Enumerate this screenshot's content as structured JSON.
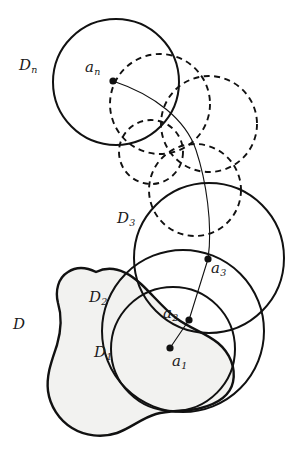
{
  "figure": {
    "kind": "mathematical-diagram",
    "background_color": "#ffffff",
    "stroke_color": "#111111",
    "region_fill": "#f2f2f0",
    "labels": {
      "region": "D",
      "disk1": "D",
      "disk1_sub": "1",
      "disk2": "D",
      "disk2_sub": "2",
      "disk3": "D",
      "disk3_sub": "3",
      "diskn": "D",
      "diskn_sub": "n",
      "point1": "a",
      "point1_sub": "1",
      "point2": "a",
      "point2_sub": "2",
      "point3": "a",
      "point3_sub": "3",
      "pointn": "a",
      "pointn_sub": "n"
    },
    "label_positions": {
      "region": {
        "x": 13,
        "y": 317
      },
      "disk1": {
        "x": 94,
        "y": 345
      },
      "disk2": {
        "x": 89,
        "y": 290
      },
      "disk3": {
        "x": 117,
        "y": 211
      },
      "diskn": {
        "x": 19,
        "y": 58
      },
      "point1": {
        "x": 172,
        "y": 354
      },
      "point2": {
        "x": 163,
        "y": 306
      },
      "point3": {
        "x": 211,
        "y": 261
      },
      "pointn": {
        "x": 85,
        "y": 60
      }
    },
    "solid_disks": [
      {
        "name": "D1",
        "cx": 173,
        "cy": 349,
        "r": 62
      },
      {
        "name": "D2",
        "cx": 183,
        "cy": 331,
        "r": 81
      },
      {
        "name": "D3",
        "cx": 209,
        "cy": 258,
        "r": 75
      },
      {
        "name": "Dn",
        "cx": 116,
        "cy": 82,
        "r": 63
      }
    ],
    "dashed_disks": [
      {
        "cx": 160,
        "cy": 104,
        "r": 50
      },
      {
        "cx": 209,
        "cy": 124,
        "r": 48
      },
      {
        "cx": 151,
        "cy": 152,
        "r": 32
      },
      {
        "cx": 195,
        "cy": 190,
        "r": 46
      }
    ],
    "points": [
      {
        "name": "a1",
        "x": 170,
        "y": 348
      },
      {
        "name": "a2",
        "x": 189,
        "y": 320
      },
      {
        "name": "a3",
        "x": 208,
        "y": 259
      },
      {
        "name": "an",
        "x": 113,
        "y": 81
      }
    ],
    "path_through_points": "M170,348 L189,320 L208,259 C213,225 206,180 196,150 C186,120 155,95 113,81",
    "region_outline": "M96,272 C112,264 128,272 141,284 C152,294 163,308 176,318 C189,328 206,333 218,343 C230,353 236,368 233,382 C230,396 216,404 201,408 C186,412 170,410 156,414 C142,418 131,428 117,433 C102,438 85,436 72,428 C59,420 50,406 48,391 C46,375 52,360 57,345 C61,331 62,316 58,303 C55,291 58,278 68,272 C77,266 88,268 96,272 Z"
  }
}
